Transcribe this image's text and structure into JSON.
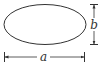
{
  "diagram": {
    "shape": "ellipse",
    "stroke_color": "#333333",
    "labels": {
      "width": "a",
      "height": "b"
    }
  }
}
